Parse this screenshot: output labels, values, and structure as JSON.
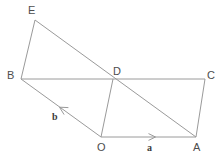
{
  "figure": {
    "width": 222,
    "height": 159,
    "background_color": "#ffffff",
    "stroke_color": "#9a9a9a",
    "stroke_width": 1,
    "label_color": "#4d4d4d",
    "vector_label_color": "#3c3c3c"
  },
  "points": {
    "E": {
      "label": "E",
      "x": 35,
      "y": 20,
      "label_x": 28,
      "label_y": 5
    },
    "B": {
      "label": "B",
      "x": 21,
      "y": 79,
      "label_x": 7,
      "label_y": 70
    },
    "D": {
      "label": "D",
      "x": 113,
      "y": 79,
      "label_x": 113,
      "label_y": 66
    },
    "C": {
      "label": "C",
      "x": 205,
      "y": 79,
      "label_x": 207,
      "label_y": 70
    },
    "O": {
      "label": "O",
      "x": 101,
      "y": 137,
      "label_x": 97,
      "label_y": 142
    },
    "A": {
      "label": "A",
      "x": 196,
      "y": 137,
      "label_x": 193,
      "label_y": 142
    }
  },
  "segments": [
    {
      "name": "segment-E-B",
      "from": "E",
      "to": "B",
      "x1": 35,
      "y1": 20,
      "x2": 21,
      "y2": 79
    },
    {
      "name": "segment-E-A",
      "from": "E",
      "to": "A",
      "x1": 35,
      "y1": 20,
      "x2": 196,
      "y2": 137
    },
    {
      "name": "segment-B-C",
      "from": "B",
      "to": "C",
      "x1": 21,
      "y1": 79,
      "x2": 205,
      "y2": 79
    },
    {
      "name": "segment-B-O",
      "from": "B",
      "to": "O",
      "x1": 21,
      "y1": 79,
      "x2": 101,
      "y2": 137
    },
    {
      "name": "segment-D-O",
      "from": "D",
      "to": "O",
      "x1": 113,
      "y1": 79,
      "x2": 101,
      "y2": 137
    },
    {
      "name": "segment-O-A",
      "from": "O",
      "to": "A",
      "x1": 101,
      "y1": 137,
      "x2": 196,
      "y2": 137
    },
    {
      "name": "segment-A-C",
      "from": "A",
      "to": "C",
      "x1": 196,
      "y1": 137,
      "x2": 205,
      "y2": 79
    }
  ],
  "vectors": [
    {
      "name": "vector-a",
      "label": "a",
      "label_x": 147,
      "label_y": 143,
      "along": "segment-O-A",
      "direction": "O-to-A",
      "arrow_tip_x": 155,
      "arrow_tip_y": 137,
      "arrow_tail_x": 143,
      "arrow_tail_y": 137
    },
    {
      "name": "vector-b",
      "label": "b",
      "label_x": 52,
      "label_y": 112,
      "along": "segment-B-O",
      "direction": "O-to-B",
      "arrow_tip_x": 60,
      "arrow_tip_y": 107,
      "arrow_tail_x": 73,
      "arrow_tail_y": 117
    }
  ]
}
